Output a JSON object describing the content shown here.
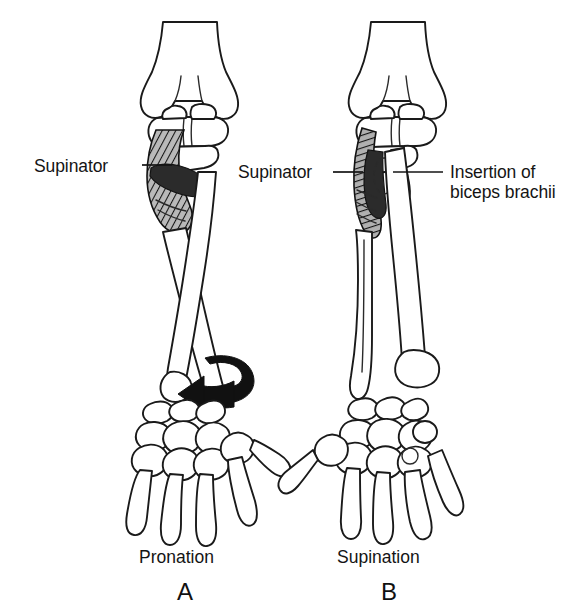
{
  "figure": {
    "background_color": "#ffffff",
    "ink_color": "#141414",
    "panels": [
      {
        "id": "A",
        "letter": "A",
        "caption": "Pronation",
        "labels": [
          {
            "name": "supinator",
            "text": "Supinator"
          }
        ],
        "bones": [
          "humerus",
          "radius",
          "ulna",
          "carpals",
          "metacarpals",
          "phalanges"
        ],
        "muscle": "supinator",
        "rotation_arrow": "curved-left-arrow-at-wrist",
        "bone_relation": "radius crossed over ulna"
      },
      {
        "id": "B",
        "letter": "B",
        "caption": "Supination",
        "labels": [
          {
            "name": "supinator",
            "text": "Supinator"
          },
          {
            "name": "biceps-insertion",
            "text_line1": "Insertion of",
            "text_line2": "biceps brachii"
          }
        ],
        "bones": [
          "humerus",
          "radius",
          "ulna",
          "carpals",
          "metacarpals",
          "phalanges"
        ],
        "muscle": "supinator",
        "insertion_marker": "dashed oval on radial tuberosity",
        "bone_relation": "radius parallel to ulna"
      }
    ]
  },
  "labels": {
    "supinator_a": "Supinator",
    "supinator_b": "Supinator",
    "insertion_line1": "Insertion of",
    "insertion_line2": "biceps brachii"
  },
  "captions": {
    "panel_a": "Pronation",
    "panel_b": "Supination",
    "letter_a": "A",
    "letter_b": "B"
  }
}
